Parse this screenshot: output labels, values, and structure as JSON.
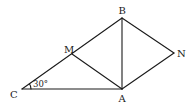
{
  "figure": {
    "points": {
      "A": {
        "label": "A",
        "x": 122,
        "y": 89
      },
      "B": {
        "label": "B",
        "x": 122,
        "y": 18
      },
      "C": {
        "label": "C",
        "x": 22,
        "y": 89
      },
      "M": {
        "label": "M",
        "x": 72,
        "y": 54
      },
      "N": {
        "label": "N",
        "x": 174,
        "y": 53
      }
    },
    "segments": [
      "CB",
      "CA",
      "AB",
      "MA",
      "BN",
      "NA"
    ],
    "angle": {
      "vertex": "C",
      "label": "30°"
    }
  }
}
